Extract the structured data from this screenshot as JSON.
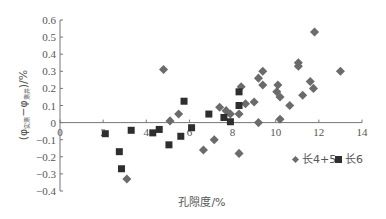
{
  "chart_data": {
    "type": "scatter",
    "title": "",
    "xlabel": "孔隙度/%",
    "ylabel": "(φ实测 − φ测井)/%",
    "xlim": [
      0,
      14
    ],
    "ylim": [
      -0.4,
      0.6
    ],
    "x_ticks": [
      0,
      2,
      4,
      6,
      8,
      10,
      12,
      14
    ],
    "y_ticks": [
      -0.4,
      -0.3,
      -0.2,
      -0.1,
      0,
      0.1,
      0.2,
      0.3,
      0.4,
      0.5,
      0.6
    ],
    "grid": false,
    "legend_position": "lower-right",
    "series": [
      {
        "name": "长4+5",
        "marker": "diamond",
        "color": "#6b6b6b",
        "points": [
          [
            3.1,
            -0.33
          ],
          [
            4.8,
            0.31
          ],
          [
            5.1,
            0.01
          ],
          [
            5.5,
            0.05
          ],
          [
            6.65,
            -0.16
          ],
          [
            7.15,
            -0.1
          ],
          [
            7.4,
            0.09
          ],
          [
            7.7,
            0.07
          ],
          [
            7.9,
            0.05
          ],
          [
            8.3,
            0.05
          ],
          [
            8.3,
            -0.18
          ],
          [
            8.4,
            0.21
          ],
          [
            8.6,
            0.11
          ],
          [
            9.0,
            0.12
          ],
          [
            9.2,
            0.26
          ],
          [
            9.4,
            0.3
          ],
          [
            9.4,
            0.22
          ],
          [
            9.2,
            0.0
          ],
          [
            10.1,
            0.22
          ],
          [
            10.05,
            0.18
          ],
          [
            10.2,
            0.15
          ],
          [
            10.2,
            0.02
          ],
          [
            10.65,
            0.1
          ],
          [
            11.05,
            0.35
          ],
          [
            11.05,
            0.33
          ],
          [
            11.25,
            0.16
          ],
          [
            11.6,
            0.24
          ],
          [
            11.75,
            0.2
          ],
          [
            11.8,
            0.53
          ],
          [
            13.0,
            0.3
          ]
        ]
      },
      {
        "name": "长6",
        "marker": "square",
        "color": "#2e2e2e",
        "points": [
          [
            2.1,
            -0.065
          ],
          [
            2.75,
            -0.17
          ],
          [
            2.85,
            -0.27
          ],
          [
            3.3,
            -0.045
          ],
          [
            4.3,
            -0.06
          ],
          [
            4.6,
            -0.04
          ],
          [
            5.05,
            -0.13
          ],
          [
            5.6,
            -0.08
          ],
          [
            5.75,
            0.125
          ],
          [
            6.1,
            -0.03
          ],
          [
            6.9,
            0.05
          ],
          [
            7.6,
            0.03
          ],
          [
            7.9,
            0.005
          ],
          [
            8.3,
            0.18
          ],
          [
            8.3,
            0.1
          ]
        ]
      }
    ]
  },
  "axis": {
    "xlabel": "孔隙度/%",
    "ylabel_prefix": "(φ",
    "ylabel_sub1": "实测",
    "ylabel_mid": "−φ",
    "ylabel_sub2": "测井",
    "ylabel_suffix": ")/%"
  },
  "legend": {
    "item1": "长4+5",
    "item2": "长6"
  }
}
